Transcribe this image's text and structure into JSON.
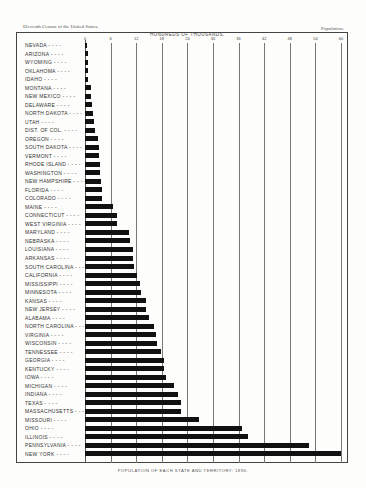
{
  "header": {
    "left": "Eleventh Census of the United States.",
    "right": "Population."
  },
  "chart_data": {
    "type": "bar",
    "orientation": "horizontal",
    "title": "POPULATION OF EACH STATE AND TERRITORY: 1890.",
    "xlabel": "HUNDREDS OF THOUSANDS.",
    "ylabel": "",
    "xlim": [
      0,
      60
    ],
    "xticks": [
      0,
      6,
      12,
      18,
      24,
      30,
      36,
      42,
      48,
      54,
      60
    ],
    "grid": true,
    "legend": null,
    "categories": [
      "NEVADA",
      "ARIZONA",
      "WYOMING",
      "OKLAHOMA",
      "IDAHO",
      "MONTANA",
      "NEW MEXICO",
      "DELAWARE",
      "NORTH DAKOTA",
      "UTAH",
      "DIST. OF COL.",
      "OREGON",
      "SOUTH DAKOTA",
      "VERMONT",
      "RHODE ISLAND",
      "WASHINGTON",
      "NEW HAMPSHIRE",
      "FLORIDA",
      "COLORADO",
      "MAINE",
      "CONNECTICUT",
      "WEST VIRGINIA",
      "MARYLAND",
      "NEBRASKA",
      "LOUISIANA",
      "ARKANSAS",
      "SOUTH CAROLINA",
      "CALIFORNIA",
      "MISSISSIPPI",
      "MINNESOTA",
      "KANSAS",
      "NEW JERSEY",
      "ALABAMA",
      "NORTH CAROLINA",
      "VIRGINIA",
      "WISCONSIN",
      "TENNESSEE",
      "GEORGIA",
      "KENTUCKY",
      "IOWA",
      "MICHIGAN",
      "INDIANA",
      "TEXAS",
      "MASSACHUSETTS",
      "MISSOURI",
      "OHIO",
      "ILLINOIS",
      "PENNSYLVANIA",
      "NEW YORK"
    ],
    "values": [
      0.5,
      0.6,
      0.6,
      0.6,
      0.8,
      1.3,
      1.5,
      1.7,
      1.8,
      2.1,
      2.3,
      3.1,
      3.3,
      3.3,
      3.5,
      3.6,
      3.8,
      3.9,
      4.1,
      6.6,
      7.5,
      7.6,
      10.4,
      10.6,
      11.2,
      11.3,
      11.5,
      12.1,
      12.9,
      13.1,
      14.3,
      14.4,
      15.1,
      16.2,
      16.6,
      16.9,
      17.7,
      18.4,
      18.6,
      19.1,
      20.9,
      21.9,
      22.4,
      22.4,
      26.8,
      36.7,
      38.3,
      52.6,
      60.0
    ]
  },
  "caption": "POPULATION OF EACH STATE AND TERRITORY: 1890."
}
